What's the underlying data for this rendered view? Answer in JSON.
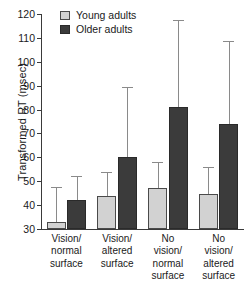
{
  "chart_data": {
    "type": "bar",
    "title": "",
    "xlabel": "",
    "ylabel": "Transformed RT (msec)",
    "ylim": [
      30,
      120
    ],
    "yticks": [
      30,
      40,
      50,
      60,
      70,
      80,
      90,
      100,
      110,
      120
    ],
    "ytick_labels": [
      "30",
      "40",
      "50",
      "60",
      "70",
      "80",
      "90",
      "100",
      "110",
      "120"
    ],
    "grid": false,
    "legend_position": "top-left",
    "categories": [
      "Vision/\nnormal\nsurface",
      "Vision/\naltered\nsurface",
      "No\nvision/\nnormal\nsurface",
      "No\nvision/\naltered\nsurface"
    ],
    "series": [
      {
        "name": "Young adults",
        "color": "#d2d2d2",
        "values": [
          33,
          44,
          47,
          44.5
        ],
        "errors_upper": [
          47.5,
          54,
          58,
          56
        ]
      },
      {
        "name": "Older adults",
        "color": "#3b3b3b",
        "values": [
          42,
          60,
          81,
          74
        ],
        "errors_upper": [
          52,
          89.5,
          117.5,
          108.5
        ]
      }
    ]
  },
  "legend": {
    "items": [
      {
        "label": "Young adults",
        "swatch": "young"
      },
      {
        "label": "Older adults",
        "swatch": "older"
      }
    ]
  }
}
